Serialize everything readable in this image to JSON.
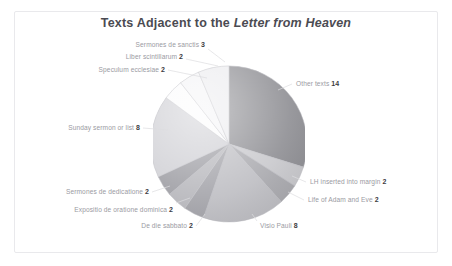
{
  "chart_title_prefix": "Texts Adjacent to the ",
  "chart_title_italic": "Letter from Heaven",
  "chart_data": {
    "type": "pie",
    "title": "Texts Adjacent to the Letter from Heaven",
    "total": 47,
    "legend": "none",
    "start_angle_deg": 0,
    "direction": "clockwise",
    "labels": [
      "Other texts",
      "LH inserted into margin",
      "Life of Adam and Eve",
      "Visio Pauli",
      "De die sabbato",
      "Expositio de oratione dominica",
      "Sermones de dedicatione",
      "Sunday sermon or list",
      "Speculum ecclesiae",
      "Liber scintillarum",
      "Sermones de sanctis"
    ],
    "values": [
      14,
      2,
      2,
      8,
      2,
      2,
      2,
      8,
      2,
      2,
      3
    ],
    "slices": [
      {
        "label": "Other texts",
        "value": 14,
        "color": "#8e8e93"
      },
      {
        "label": "LH inserted into margin",
        "value": 2,
        "color": "#c8c8cc"
      },
      {
        "label": "Life of Adam and Eve",
        "value": 2,
        "color": "#a9a9ae"
      },
      {
        "label": "Visio Pauli",
        "value": 8,
        "color": "#bdbdc2"
      },
      {
        "label": "De die sabbato",
        "value": 2,
        "color": "#a2a2a8"
      },
      {
        "label": "Expositio de oratione dominica",
        "value": 2,
        "color": "#b6b6bb"
      },
      {
        "label": "Sermones de dedicatione",
        "value": 2,
        "color": "#9c9ca2"
      },
      {
        "label": "Sunday sermon or list",
        "value": 8,
        "color": "#cfcfd4"
      },
      {
        "label": "Speculum ecclesiae",
        "value": 2,
        "color": "#fbfbfc"
      },
      {
        "label": "Liber scintillarum",
        "value": 2,
        "color": "#f4f4f6"
      },
      {
        "label": "Sermones de sanctis",
        "value": 3,
        "color": "#ececef"
      }
    ]
  },
  "labels": {
    "sermones_de_sanctis": {
      "text": "Sermones de sanctis",
      "value": "3"
    },
    "liber_scintillarum": {
      "text": "Liber scintillarum",
      "value": "2"
    },
    "speculum_ecclesiae": {
      "text": "Speculum ecclesiae",
      "value": "2"
    },
    "sunday_sermon": {
      "text": "Sunday sermon or list",
      "value": "8"
    },
    "sermones_dedicatione": {
      "text": "Sermones de dedicatione",
      "value": "2"
    },
    "expositio_oratione": {
      "text": "Expositio de oratione dominica",
      "value": "2"
    },
    "de_die_sabbato": {
      "text": "De die sabbato",
      "value": "2"
    },
    "visio_pauli": {
      "text": "Visio Pauli",
      "value": "8"
    },
    "other_texts": {
      "text": "Other texts",
      "value": "14"
    },
    "lh_inserted": {
      "text": "LH inserted into margin",
      "value": "2"
    },
    "life_adam_eve": {
      "text": "Life of Adam and Eve",
      "value": "2"
    }
  }
}
